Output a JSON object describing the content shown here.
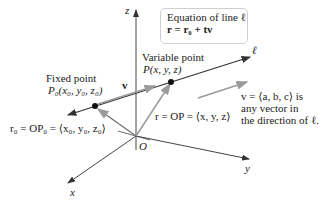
{
  "diagram": {
    "axes": {
      "z_label": "z",
      "y_label": "y",
      "x_label": "x",
      "origin_label": "O"
    },
    "line_label": "ℓ",
    "equation_box": {
      "title": "Equation of line ℓ",
      "equation": "r = r₀ + tv"
    },
    "fixed_point": {
      "title": "Fixed point",
      "coords": "P₀(x₀, y₀, z₀)",
      "position_vector": "r₀ = OP₀ = ⟨x₀, y₀, z₀⟩"
    },
    "variable_point": {
      "title": "Variable point",
      "coords": "P(x, y, z)",
      "position_vector": "r = OP = ⟨x, y, z⟩"
    },
    "direction_vector": {
      "label": "v",
      "description_line1": "v = ⟨a, b, c⟩ is",
      "description_line2": "any vector in",
      "description_line3": "the direction of ℓ."
    },
    "colors": {
      "line": "#333333",
      "vector_gray": "#9a9a9a",
      "axis": "#444444",
      "point": "#111111",
      "box_border": "#cfcfcf"
    }
  }
}
